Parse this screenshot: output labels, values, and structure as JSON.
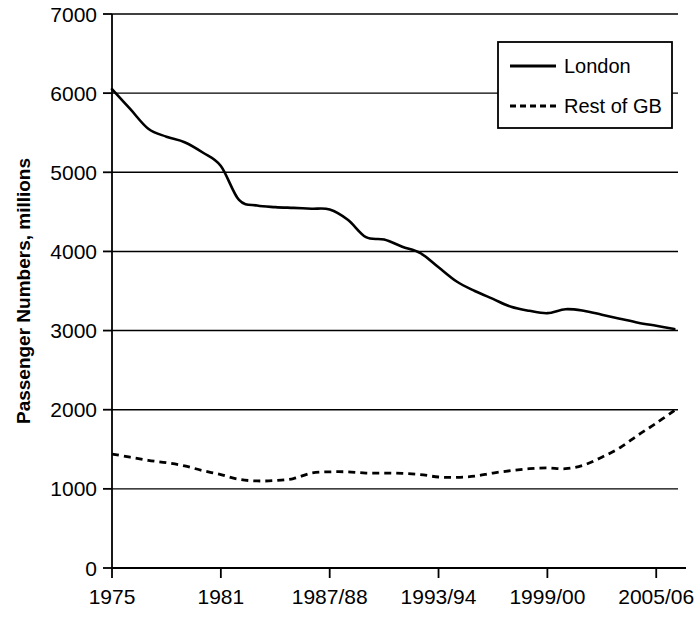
{
  "chart_data": {
    "type": "line",
    "title": "",
    "xlabel": "",
    "ylabel": "Passenger Numbers, millions",
    "ylim": [
      0,
      7000
    ],
    "ytick_values": [
      0,
      1000,
      2000,
      3000,
      4000,
      5000,
      6000,
      7000
    ],
    "ytick_labels": [
      "0",
      "1000",
      "2000",
      "3000",
      "4000",
      "5000",
      "6000",
      "7000"
    ],
    "xtick_labels": [
      "1975",
      "1981",
      "1987/88",
      "1993/94",
      "1999/00",
      "2005/06"
    ],
    "xtick_years": [
      1975,
      1981,
      1987,
      1993,
      1999,
      2005
    ],
    "xlim": [
      1975,
      2006.2
    ],
    "grid": "horizontal",
    "legend_position": "top-right",
    "legend": [
      "London",
      "Rest of GB"
    ],
    "series": [
      {
        "name": "London",
        "style": "solid",
        "color": "#000000",
        "x": [
          1975,
          1976,
          1977,
          1978,
          1979,
          1980,
          1981,
          1982,
          1983,
          1984,
          1985,
          1986,
          1987,
          1988,
          1989,
          1990,
          1991,
          1992,
          1993,
          1994,
          1995,
          1996,
          1997,
          1998,
          1999,
          2000,
          2001,
          2002,
          2003,
          2004,
          2005
        ],
        "values": [
          6050,
          5800,
          5550,
          5450,
          5380,
          5250,
          5080,
          4650,
          4580,
          4560,
          4550,
          4540,
          4530,
          4400,
          4180,
          4150,
          4060,
          3980,
          3800,
          3620,
          3500,
          3400,
          3300,
          3250,
          3220,
          3270,
          3250,
          3200,
          3150,
          3100,
          3060
        ]
      },
      {
        "name": "Rest of GB",
        "style": "dashed",
        "color": "#000000",
        "x": [
          1975,
          1976,
          1977,
          1978,
          1979,
          1980,
          1981,
          1982,
          1983,
          1984,
          1985,
          1986,
          1987,
          1988,
          1989,
          1990,
          1991,
          1992,
          1993,
          1994,
          1995,
          1996,
          1997,
          1998,
          1999,
          2000,
          2001,
          2002,
          2003,
          2004,
          2005
        ],
        "values": [
          1440,
          1400,
          1360,
          1330,
          1290,
          1230,
          1180,
          1120,
          1100,
          1105,
          1130,
          1200,
          1215,
          1215,
          1200,
          1200,
          1195,
          1180,
          1150,
          1145,
          1160,
          1200,
          1230,
          1255,
          1265,
          1255,
          1300,
          1400,
          1520,
          1680,
          1830
        ]
      }
    ],
    "endpoints": {
      "london_final": 3020,
      "restofgb_final": 1990,
      "final_year_label": "2005/06"
    }
  },
  "plot_geometry": {
    "left": 112,
    "right": 678,
    "top": 14,
    "bottom": 568
  },
  "legend_box": {
    "x": 498,
    "y": 42,
    "width": 174,
    "height": 86
  }
}
